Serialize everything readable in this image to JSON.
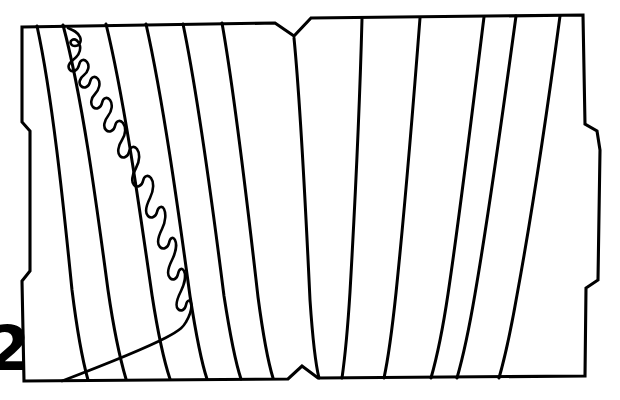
{
  "figure": {
    "label": "2",
    "caption_visible": false,
    "background_color": "#ffffff",
    "ink_color": "#000000",
    "width": 620,
    "height": 400
  },
  "outline": {
    "name": "shell-fragment-outline",
    "stroke": "#000000",
    "fill": "#ffffff",
    "path": "M 22,27 L 275,23 L 294,36 L 311,18 L 583,15 L 585,124 L 597,131 L 600,150 L 598,280 L 586,288 L 585,376 L 318,378 L 302,366 L 288,379 L 24,381 L 22,281 L 30,271 L 30,131 L 22,122 Z",
    "notches": [
      {
        "name": "top-center-v-notch",
        "x": 294,
        "y": 36
      },
      {
        "name": "bottom-center-v-notch",
        "x": 302,
        "y": 366
      },
      {
        "name": "left-edge-step-upper",
        "x": 30,
        "y": 131
      },
      {
        "name": "left-edge-step-lower",
        "x": 30,
        "y": 271
      },
      {
        "name": "right-edge-step-upper",
        "x": 597,
        "y": 131
      },
      {
        "name": "right-edge-step-lower",
        "x": 586,
        "y": 288
      }
    ]
  },
  "growth_lines": {
    "name": "growth-lines",
    "count": 12,
    "stroke": "#000000",
    "paths": [
      "M 37,26 C 52,95 63,200 72,290 C 78,338 83,362 88,380",
      "M 63,25 C 82,96 96,200 108,290 C 115,338 121,362 126,379",
      "M 106,24 C 124,98 139,205 152,295 C 159,340 165,364 170,379",
      "M 146,24 C 163,100 178,208 190,296 C 197,341 202,364 207,379",
      "M 183,24 C 199,101 213,209 224,296 C 231,341 236,364 241,379",
      "M 222,23 C 236,102 248,210 258,297 C 264,342 269,365 273,378",
      "M 294,38 C 301,110 306,215 310,300 C 313,344 316,366 319,378",
      "M 362,19 C 360,95 355,205 350,292 C 347,340 344,364 342,378",
      "M 420,18 C 414,96 405,206 396,293 C 391,340 387,364 384,378",
      "M 484,17 C 474,97 461,207 448,294 C 441,341 435,364 431,378",
      "M 516,16 C 505,97 490,207 475,294 C 467,341 461,364 457,378",
      "M 560,16 C 549,98 533,208 517,295 C 509,341 503,364 499,378"
    ]
  },
  "suture_line": {
    "name": "suture-line",
    "stroke": "#000000",
    "style": "crenulated-fractal",
    "lobes": 9,
    "path": "M 68,28 C 73,30 78,32 80,37 C 82,42 79,46 75,46 C 71,46 69,42 72,40 C 75,38 79,41 80,46 C 81,52 77,57 73,60 C 69,63 67,67 70,70 C 73,73 78,70 79,65 C 80,60 84,58 87,62 C 90,66 88,72 84,75 C 80,78 78,83 81,86 C 84,89 89,87 90,82 C 91,77 95,75 98,79 C 101,83 99,90 95,94 C 91,98 90,104 93,107 C 96,110 101,108 102,103 C 103,98 107,96 110,100 C 113,104 112,111 108,116 C 104,121 103,127 106,130 C 109,133 114,131 115,126 C 116,121 120,119 123,123 C 126,127 126,134 122,140 C 118,146 117,153 120,156 C 123,159 128,157 129,152 C 130,147 134,145 137,149 C 140,153 140,161 136,168 C 132,175 131,182 134,185 C 137,188 142,186 143,181 C 144,176 148,174 151,178 C 154,182 154,190 150,198 C 146,206 145,213 148,216 C 151,219 156,217 157,212 C 158,207 162,205 164,209 C 166,213 166,221 162,229 C 158,237 157,244 160,247 C 163,250 168,248 169,243 C 170,238 173,236 175,240 C 177,244 176,252 172,260 C 168,268 167,275 170,278 C 173,281 177,279 178,274 C 179,269 182,267 184,271 C 186,275 185,283 181,291 C 177,299 175,306 178,309 C 181,312 185,310 186,305 C 187,300 190,299 191,303 C 192,307 190,315 186,322 C 182,329 180,335 82,0",
    "path_fixed": "M 68,28 C 73,30 78,32 80,37 C 82,42 79,46 75,46 C 71,46 69,42 72,40 C 75,38 79,41 80,46 C 81,52 77,57 73,60 C 69,63 67,67 70,70 C 73,73 78,70 79,65 C 80,60 84,58 87,62 C 90,66 88,72 84,75 C 80,78 78,83 81,86 C 84,89 89,87 90,82 C 91,77 95,75 98,79 C 101,83 99,90 95,94 C 91,98 90,104 93,107 C 96,110 101,108 102,103 C 103,98 107,96 110,100 C 113,104 112,111 108,116 C 104,121 103,127 106,130 C 109,133 114,131 115,126 C 116,121 120,119 123,123 C 126,127 126,134 122,140 C 118,146 117,153 120,156 C 123,159 128,157 129,152 C 130,147 134,145 137,149 C 140,153 140,161 136,168 C 132,175 131,182 134,185 C 137,188 142,186 143,181 C 144,176 148,174 151,178 C 154,182 154,190 150,198 C 146,206 145,213 148,216 C 151,219 156,217 157,212 C 158,207 162,205 164,209 C 166,213 166,221 162,229 C 158,237 157,244 160,247 C 163,250 168,248 169,243 C 170,238 173,236 175,240 C 177,244 176,252 172,260 C 168,268 167,275 170,278 C 173,281 177,279 178,274 C 179,269 182,267 184,271 C 186,275 185,283 181,291 C 177,299 175,306 178,309 C 181,312 185,310 186,305 C 187,300 190,299 191,303 C 192,307 190,315 186,322 C 182,329 180,336 62,381"
  }
}
